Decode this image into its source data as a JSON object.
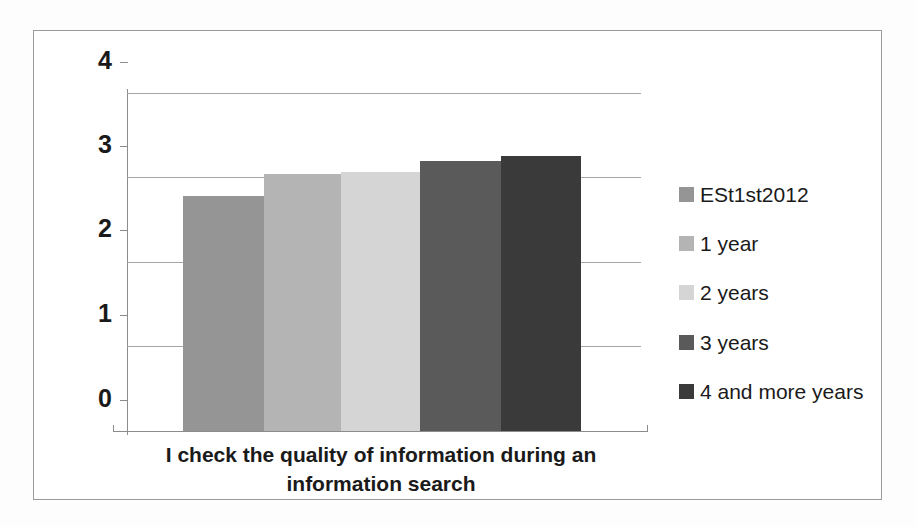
{
  "chart_data": {
    "type": "bar",
    "title": "",
    "subtitle": "",
    "xlabel": "I check the quality of information during an information search",
    "ylabel": "",
    "categories": [
      "I check the quality of information during an information search"
    ],
    "category_lines": [
      "I check the quality of information during an",
      "information search"
    ],
    "ylim": [
      0,
      4
    ],
    "yticks": [
      0,
      1,
      2,
      3,
      4
    ],
    "ytick_labels": [
      "0",
      "1",
      "2",
      "3",
      "4"
    ],
    "grid": true,
    "grid_axis": "y",
    "legend_position": "right",
    "series": [
      {
        "name": "ESt1st2012",
        "values": [
          2.78
        ],
        "color": "#959595"
      },
      {
        "name": "1 year",
        "values": [
          3.04
        ],
        "color": "#b4b4b4"
      },
      {
        "name": "2 years",
        "values": [
          3.07
        ],
        "color": "#d5d5d5"
      },
      {
        "name": "3 years",
        "values": [
          3.2
        ],
        "color": "#5a5a5a"
      },
      {
        "name": "4 and more years",
        "values": [
          3.26
        ],
        "color": "#3a3a3a"
      }
    ]
  },
  "legend": {
    "items": [
      {
        "label": "ESt1st2012",
        "color": "#959595"
      },
      {
        "label": "1 year",
        "color": "#b4b4b4"
      },
      {
        "label": "2 years",
        "color": "#d5d5d5"
      },
      {
        "label": "3 years",
        "color": "#5a5a5a"
      },
      {
        "label": "4 and more years",
        "color": "#3a3a3a"
      }
    ]
  },
  "axis": {
    "y_labels": [
      "4",
      "3",
      "2",
      "1",
      "0"
    ]
  },
  "category_axis": {
    "line1": "I check the quality of information during an",
    "line2": "information search"
  }
}
